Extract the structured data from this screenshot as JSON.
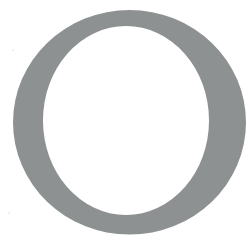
{
  "figure": {
    "glyph": "O",
    "glyph_style": "serif-capital",
    "color": "#8e9192",
    "background": "#ffffff"
  }
}
